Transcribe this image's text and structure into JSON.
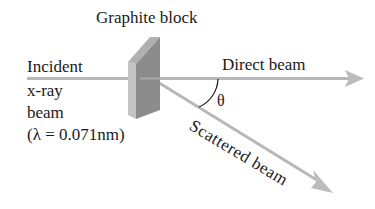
{
  "diagram": {
    "title": "Graphite block",
    "incident": {
      "line1": "Incident",
      "line2": "x-ray",
      "line3": "beam",
      "wavelength": "(λ = 0.071nm)"
    },
    "direct_beam_label": "Direct beam",
    "scattered_beam_label": "Scattered beam",
    "angle_label": "θ",
    "colors": {
      "beam": "#b8b8b8",
      "block_front": "#8a8a8a",
      "block_side": "#bdbdbd",
      "block_top": "#a8a8a8",
      "text": "#1a1a1a"
    }
  }
}
